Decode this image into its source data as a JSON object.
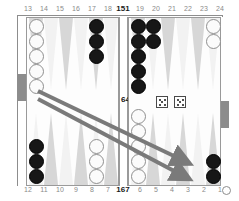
{
  "board": {
    "title": "backgammon-board",
    "game_type": "backgammon",
    "top_point_labels": [
      "13",
      "14",
      "15",
      "16",
      "17",
      "18",
      "19",
      "20",
      "21",
      "22",
      "23",
      "24"
    ],
    "bottom_point_labels": [
      "12",
      "11",
      "10",
      "9",
      "8",
      "7",
      "6",
      "5",
      "4",
      "3",
      "2",
      "1"
    ],
    "pip_counts": {
      "top_label": "151",
      "bottom_label": "167",
      "bar_label": "64"
    },
    "bearoff_label": "O",
    "colors": {
      "black_checker": "#171717",
      "white_checker": "#fbfbfb",
      "point_dark": "#d7d7d7",
      "point_light": "#f2f2f2",
      "frame": "#8d8d8d",
      "tray_block": "#8c8c8c",
      "arrow": "#7a7a7a",
      "label_text": "#8a8a8a",
      "pip_text": "#1a1a1a"
    }
  },
  "dice": [
    {
      "name": "die-left",
      "value": 5,
      "pips": 5
    },
    {
      "name": "die-right",
      "value": 5,
      "pips": 5
    }
  ],
  "checkers": [
    {
      "point": "13",
      "color": "white",
      "count": 5
    },
    {
      "point": "17",
      "color": "black",
      "count": 3
    },
    {
      "point": "19",
      "color": "black",
      "count": 5
    },
    {
      "point": "20",
      "color": "black",
      "count": 2
    },
    {
      "point": "24",
      "color": "white",
      "count": 2
    },
    {
      "point": "12",
      "color": "black",
      "count": 3
    },
    {
      "point": "8",
      "color": "white",
      "count": 3
    },
    {
      "point": "6",
      "color": "white",
      "count": 5
    },
    {
      "point": "1",
      "color": "black",
      "count": 2
    }
  ],
  "move_arrows": [
    {
      "name": "move-arrow-1",
      "from_point": "13",
      "to_point": "3"
    },
    {
      "name": "move-arrow-2",
      "from_point": "13",
      "to_point": "2"
    }
  ]
}
